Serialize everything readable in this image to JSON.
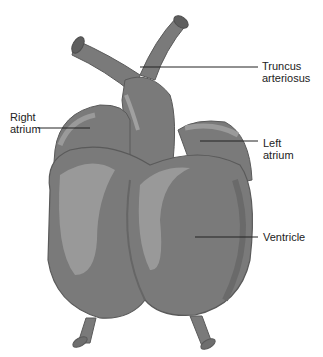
{
  "figure": {
    "colors": {
      "background": "#ffffff",
      "tissue_base": "#7a7a7a",
      "tissue_dark": "#6a6a6a",
      "tissue_light": "#9a9a9a",
      "outline": "#5a5a5a",
      "leader_line": "#222222",
      "text": "#222222"
    }
  },
  "labels": {
    "truncus_line1": "Truncus",
    "truncus_line2": "arteriosus",
    "right_atrium_line1": "Right",
    "right_atrium_line2": "atrium",
    "left_atrium_line1": "Left",
    "left_atrium_line2": "atrium",
    "ventricle": "Ventricle"
  }
}
